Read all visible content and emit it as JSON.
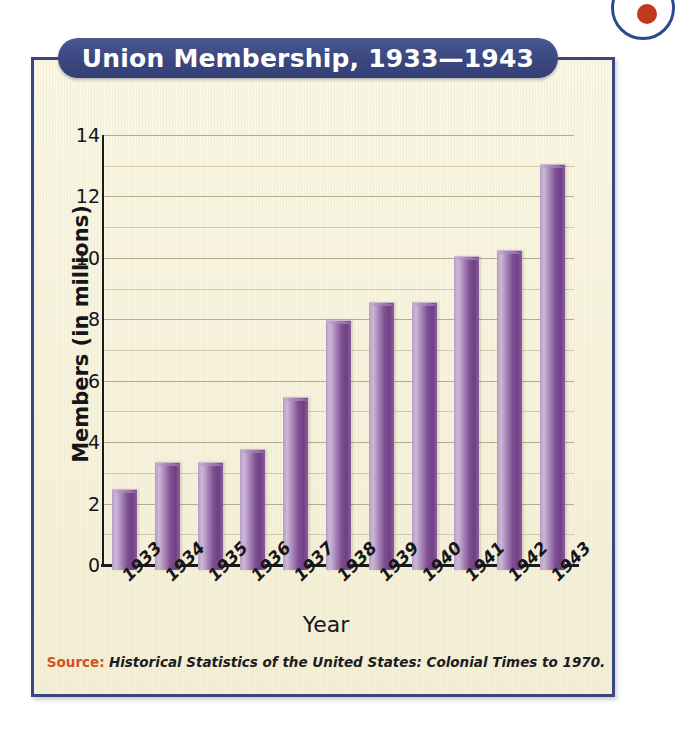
{
  "figure": {
    "title": "Union Membership, 1933—1943",
    "badge_icon": "circle-badge-icon",
    "source_label": "Source:",
    "source_text": "Historical Statistics of the United States: Colonial Times to 1970.",
    "colors": {
      "banner": "#3b4780",
      "panel_background": "#f7f3dd",
      "panel_border": "#3b4780",
      "bar_light": "#cdb8d6",
      "bar_dark": "#6f4083",
      "gridline": "#b3ad8c",
      "source_label": "#d2521e",
      "text": "#15151a"
    }
  },
  "chart_data": {
    "type": "bar",
    "title": "Union Membership, 1933—1943",
    "xlabel": "Year",
    "ylabel": "Members (in millions)",
    "categories": [
      "1933",
      "1934",
      "1935",
      "1936",
      "1937",
      "1938",
      "1939",
      "1940",
      "1941",
      "1942",
      "1943"
    ],
    "values": [
      2.6,
      3.5,
      3.5,
      3.9,
      5.6,
      8.1,
      8.7,
      8.7,
      10.2,
      10.4,
      13.2
    ],
    "ylim": [
      0,
      14
    ],
    "ytick_labels": [
      "0",
      "2",
      "4",
      "6",
      "8",
      "10",
      "12",
      "14"
    ],
    "ytick_values": [
      0,
      2,
      4,
      6,
      8,
      10,
      12,
      14
    ],
    "minor_gridline_values": [
      1,
      3,
      5,
      7,
      9,
      11,
      13
    ],
    "grid": true,
    "legend": "none",
    "source": "Historical Statistics of the United States: Colonial Times to 1970."
  }
}
